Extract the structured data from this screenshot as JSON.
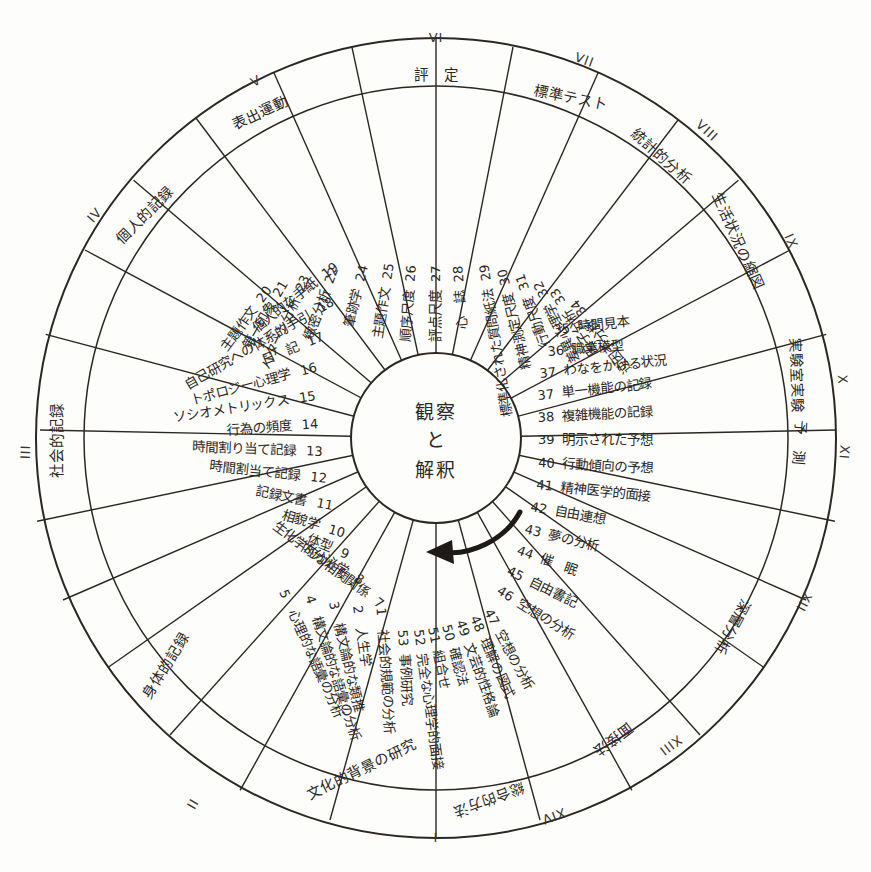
{
  "diagram": {
    "title_center": "観察\nと\n解釈",
    "center_lines": [
      "観察",
      "と",
      "解釈"
    ],
    "type": "radial-wheel",
    "ink_color": "#2b2722",
    "background_color": "#fdfdfb",
    "arrow_name": "clockwise-flow-arrow"
  },
  "sectors": [
    {
      "roman": "I",
      "label": "文化的背景の研究"
    },
    {
      "roman": "II",
      "label": "身体的記録"
    },
    {
      "roman": "III",
      "label": "社会的記録"
    },
    {
      "roman": "IV",
      "label": "個人的記録"
    },
    {
      "roman": "V",
      "label": "表出運動"
    },
    {
      "roman": "VI",
      "label": "評　定"
    },
    {
      "roman": "VII",
      "label": "標準テスト"
    },
    {
      "roman": "VIII",
      "label": "統計的分析"
    },
    {
      "roman": "IX",
      "label": "生活状況の縮図"
    },
    {
      "roman": "X",
      "label": "実験室実験"
    },
    {
      "roman": "XI",
      "label": "予　測"
    },
    {
      "roman": "XII",
      "label": "深層分析"
    },
    {
      "roman": "XIII",
      "label": "面接法"
    },
    {
      "roman": "XIV",
      "label": "総合的方法"
    },
    {
      "roman": "XV",
      "label": "総合的方法"
    }
  ],
  "items": [
    {
      "num": "1",
      "label": "社会的規範の分析"
    },
    {
      "num": "2",
      "label": "人生学"
    },
    {
      "num": "3",
      "label": "構文論的な類推"
    },
    {
      "num": "4",
      "label": "構文論的な語彙の分析"
    },
    {
      "num": "5",
      "label": "心理的な語彙の分析"
    },
    {
      "num": "6",
      "label": "生化学的な相関関係"
    },
    {
      "num": "7",
      "label": "内分泌学"
    },
    {
      "num": "8",
      "label": "体型"
    },
    {
      "num": "9",
      "label": "相貌学"
    },
    {
      "num": "10",
      "label": "記録文書"
    },
    {
      "num": "11",
      "label": "時間割当て記録"
    },
    {
      "num": "12",
      "label": "時間割り当て記録"
    },
    {
      "num": "13",
      "label": "行為の頻度"
    },
    {
      "num": "14",
      "label": "ソシオメトリックス"
    },
    {
      "num": "15",
      "label": "トポロジー心理学"
    },
    {
      "num": "16",
      "label": "日　記"
    },
    {
      "num": "17",
      "label": "自己研究への体系的手引"
    },
    {
      "num": "18",
      "label": "個人的な手紙"
    },
    {
      "num": "19",
      "label": "個人的な手紙"
    },
    {
      "num": "20",
      "label": "主題作文"
    },
    {
      "num": "21",
      "label": "第一印象"
    },
    {
      "num": "22",
      "label": "緻密分析"
    },
    {
      "num": "23",
      "label": "パターン分析"
    },
    {
      "num": "24",
      "label": "筆跡学"
    },
    {
      "num": "25",
      "label": "主題作文"
    },
    {
      "num": "26",
      "label": "順序尺度"
    },
    {
      "num": "27",
      "label": "評点尺度"
    },
    {
      "num": "28",
      "label": "心　誌"
    },
    {
      "num": "29",
      "label": "標準化された質問紙法"
    },
    {
      "num": "30",
      "label": "精神測定尺度"
    },
    {
      "num": "31",
      "label": "行動尺度"
    },
    {
      "num": "32",
      "label": "差異心理学"
    },
    {
      "num": "33",
      "label": "因子分析"
    },
    {
      "num": "34",
      "label": "逆因子分析"
    },
    {
      "num": "35",
      "label": "時間見本"
    },
    {
      "num": "36",
      "label": "職業模型"
    },
    {
      "num": "37",
      "label": "わなをかける状況"
    },
    {
      "num": "38",
      "label": "単一機能の記録"
    },
    {
      "num": "39",
      "label": "複雑機能の記録"
    },
    {
      "num": "40",
      "label": "明示された予想"
    },
    {
      "num": "41",
      "label": "行動傾向の予想"
    },
    {
      "num": "42",
      "label": "精神医学的面接"
    },
    {
      "num": "43",
      "label": "自由連想"
    },
    {
      "num": "44",
      "label": "夢の分析"
    },
    {
      "num": "45",
      "label": "催　眠"
    },
    {
      "num": "46",
      "label": "自由書記"
    },
    {
      "num": "47",
      "label": "空想の分析"
    },
    {
      "num": "48",
      "label": "理解の図式"
    },
    {
      "num": "49",
      "label": "文芸的性格論"
    },
    {
      "num": "50",
      "label": "確認法"
    },
    {
      "num": "51",
      "label": "組合せ"
    },
    {
      "num": "52",
      "label": "完全な心理学的面接"
    },
    {
      "num": "53",
      "label": "事例研究"
    }
  ],
  "left_column_items": [
    {
      "num": "19",
      "label": "個人的な手紙"
    },
    {
      "num": "18",
      "label": "自己研究への体系的手引"
    },
    {
      "num": "17",
      "label": "日　記"
    },
    {
      "num": "16",
      "label": "トポロジー心理学"
    },
    {
      "num": "15",
      "label": "ソシオメトリックス"
    },
    {
      "num": "14",
      "label": "行為の頻度"
    },
    {
      "num": "13",
      "label": "時間割り当て記録"
    },
    {
      "num": "12",
      "label": "時間割当て記録"
    },
    {
      "num": "11",
      "label": "記録文書"
    },
    {
      "num": "10",
      "label": "相貌学"
    },
    {
      "num": "9",
      "label": "体型"
    },
    {
      "num": "8",
      "label": "内分泌学"
    },
    {
      "num": "7",
      "label": "生化学的な相関関係"
    },
    {
      "num": "6",
      "label": ""
    }
  ],
  "right_column_items": [
    {
      "num": "37",
      "label": "単一機能の記録"
    },
    {
      "num": "38",
      "label": "複雑機能の記録"
    },
    {
      "num": "39",
      "label": "明示された予想"
    },
    {
      "num": "40",
      "label": "行動傾向の予想"
    },
    {
      "num": "41",
      "label": "精神医学的面接"
    },
    {
      "num": "42",
      "label": "自由連想"
    },
    {
      "num": "43",
      "label": "夢の分析"
    },
    {
      "num": "44",
      "label": "催　眠"
    },
    {
      "num": "45",
      "label": "自由書記"
    },
    {
      "num": "46",
      "label": "空想の分析"
    }
  ]
}
